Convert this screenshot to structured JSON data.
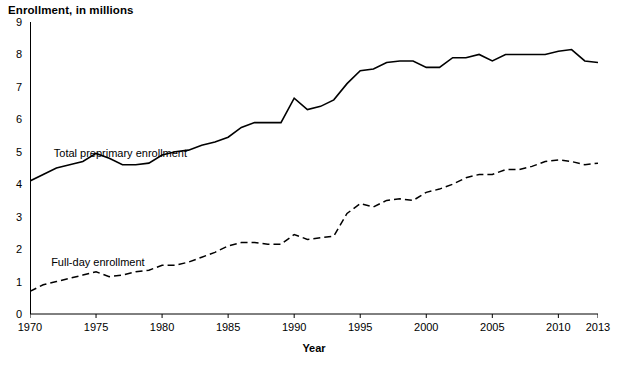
{
  "chart_data": {
    "type": "line",
    "title": "Enrollment, in millions",
    "xlabel": "Year",
    "ylabel": "",
    "xlim": [
      1970,
      2013
    ],
    "ylim": [
      0,
      9
    ],
    "grid": false,
    "legend_position": "inline-annotations",
    "yticks": [
      "0",
      "1",
      "2",
      "3",
      "4",
      "5",
      "6",
      "7",
      "8",
      "9"
    ],
    "xticks": [
      "1970",
      "1975",
      "1980",
      "1985",
      "1990",
      "1995",
      "2000",
      "2005",
      "2010",
      "2013"
    ],
    "x": [
      1970,
      1971,
      1972,
      1973,
      1974,
      1975,
      1976,
      1977,
      1978,
      1979,
      1980,
      1981,
      1982,
      1983,
      1984,
      1985,
      1986,
      1987,
      1988,
      1989,
      1990,
      1991,
      1992,
      1993,
      1994,
      1995,
      1996,
      1997,
      1998,
      1999,
      2000,
      2001,
      2002,
      2003,
      2004,
      2005,
      2006,
      2007,
      2008,
      2009,
      2010,
      2011,
      2012,
      2013
    ],
    "series": [
      {
        "name": "Total preprimary enrollment",
        "style": "solid",
        "values": [
          4.1,
          4.3,
          4.5,
          4.6,
          4.7,
          4.95,
          4.8,
          4.6,
          4.6,
          4.65,
          4.9,
          5.0,
          5.05,
          5.2,
          5.3,
          5.45,
          5.75,
          5.9,
          5.9,
          5.9,
          6.65,
          6.3,
          6.4,
          6.6,
          7.1,
          7.5,
          7.55,
          7.75,
          7.8,
          7.8,
          7.6,
          7.6,
          7.9,
          7.9,
          8.0,
          7.8,
          8.0,
          8.0,
          8.0,
          8.0,
          8.1,
          8.15,
          7.8,
          7.75
        ]
      },
      {
        "name": "Full-day enrollment",
        "style": "dashed",
        "values": [
          0.7,
          0.9,
          1.0,
          1.1,
          1.2,
          1.3,
          1.15,
          1.2,
          1.3,
          1.35,
          1.5,
          1.5,
          1.6,
          1.75,
          1.9,
          2.1,
          2.2,
          2.2,
          2.15,
          2.15,
          2.45,
          2.3,
          2.35,
          2.4,
          3.1,
          3.4,
          3.3,
          3.5,
          3.55,
          3.5,
          3.75,
          3.85,
          4.0,
          4.2,
          4.3,
          4.3,
          4.45,
          4.45,
          4.55,
          4.7,
          4.75,
          4.7,
          4.6,
          4.65
        ]
      }
    ],
    "annotations": [
      {
        "text": "Total preprimary enrollment",
        "x": 1971.8,
        "y": 4.9
      },
      {
        "text": "Full-day enrollment",
        "x": 1971.6,
        "y": 1.55
      }
    ]
  }
}
